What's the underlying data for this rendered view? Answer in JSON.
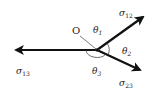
{
  "diagram": {
    "center_label": "O",
    "colors": {
      "stroke": "#111111",
      "text": "#222222",
      "background": "#ffffff"
    },
    "vectors": [
      {
        "id": "sigma12",
        "symbol": "σ",
        "subscript": "12",
        "direction": "upper-right"
      },
      {
        "id": "sigma13",
        "symbol": "σ",
        "subscript": "13",
        "direction": "left"
      },
      {
        "id": "sigma23",
        "symbol": "σ",
        "subscript": "23",
        "direction": "lower-right"
      }
    ],
    "angles": [
      {
        "id": "theta1",
        "symbol": "θ",
        "subscript": "1",
        "between": "σ13 and σ12"
      },
      {
        "id": "theta2",
        "symbol": "θ",
        "subscript": "2",
        "between": "σ12 and σ23"
      },
      {
        "id": "theta3",
        "symbol": "θ",
        "subscript": "3",
        "between": "σ23 and σ13"
      }
    ]
  }
}
